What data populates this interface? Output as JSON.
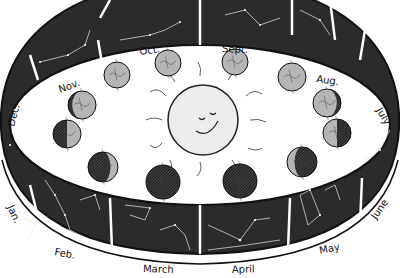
{
  "diagram": {
    "center": {
      "name": "sun",
      "face": "smiling"
    },
    "months": [
      {
        "label": "Oct.",
        "x": 140,
        "y": 55,
        "rot": -8
      },
      {
        "label": "Sept.",
        "x": 222,
        "y": 52,
        "rot": 2
      },
      {
        "label": "Nov.",
        "x": 60,
        "y": 93,
        "rot": -20
      },
      {
        "label": "Aug.",
        "x": 316,
        "y": 82,
        "rot": 8
      },
      {
        "label": "Dec.",
        "x": 14,
        "y": 127,
        "rot": -75
      },
      {
        "label": "July",
        "x": 376,
        "y": 110,
        "rot": 60
      },
      {
        "label": "Jan.",
        "x": 7,
        "y": 207,
        "rot": 65
      },
      {
        "label": "Feb.",
        "x": 54,
        "y": 255,
        "rot": 10
      },
      {
        "label": "March",
        "x": 143,
        "y": 272,
        "rot": 2
      },
      {
        "label": "April",
        "x": 232,
        "y": 273,
        "rot": -2
      },
      {
        "label": "May",
        "x": 320,
        "y": 254,
        "rot": -12
      },
      {
        "label": "June",
        "x": 376,
        "y": 220,
        "rot": -55
      }
    ],
    "earths": [
      {
        "cx": 168,
        "cy": 63,
        "r": 13,
        "phase": "lit"
      },
      {
        "cx": 117,
        "cy": 75,
        "r": 13,
        "phase": "lit"
      },
      {
        "cx": 82,
        "cy": 105,
        "r": 14,
        "phase": "crescent-dark-left"
      },
      {
        "cx": 67,
        "cy": 134,
        "r": 14,
        "phase": "half-dark-left"
      },
      {
        "cx": 103,
        "cy": 167,
        "r": 15,
        "phase": "mostly-dark"
      },
      {
        "cx": 163,
        "cy": 182,
        "r": 17,
        "phase": "dark"
      },
      {
        "cx": 240,
        "cy": 181,
        "r": 17,
        "phase": "dark"
      },
      {
        "cx": 302,
        "cy": 162,
        "r": 15,
        "phase": "mostly-dark"
      },
      {
        "cx": 337,
        "cy": 133,
        "r": 14,
        "phase": "half-dark-right"
      },
      {
        "cx": 327,
        "cy": 103,
        "r": 14,
        "phase": "crescent-dark-right"
      },
      {
        "cx": 292,
        "cy": 77,
        "r": 14,
        "phase": "lit"
      },
      {
        "cx": 235,
        "cy": 62,
        "r": 13,
        "phase": "lit"
      }
    ],
    "colors": {
      "band": "#2b2b2b",
      "earth_light": "#b5b5b5",
      "earth_dark": "#3a3a3a",
      "sun": "#ececec",
      "stroke": "#111111"
    }
  }
}
